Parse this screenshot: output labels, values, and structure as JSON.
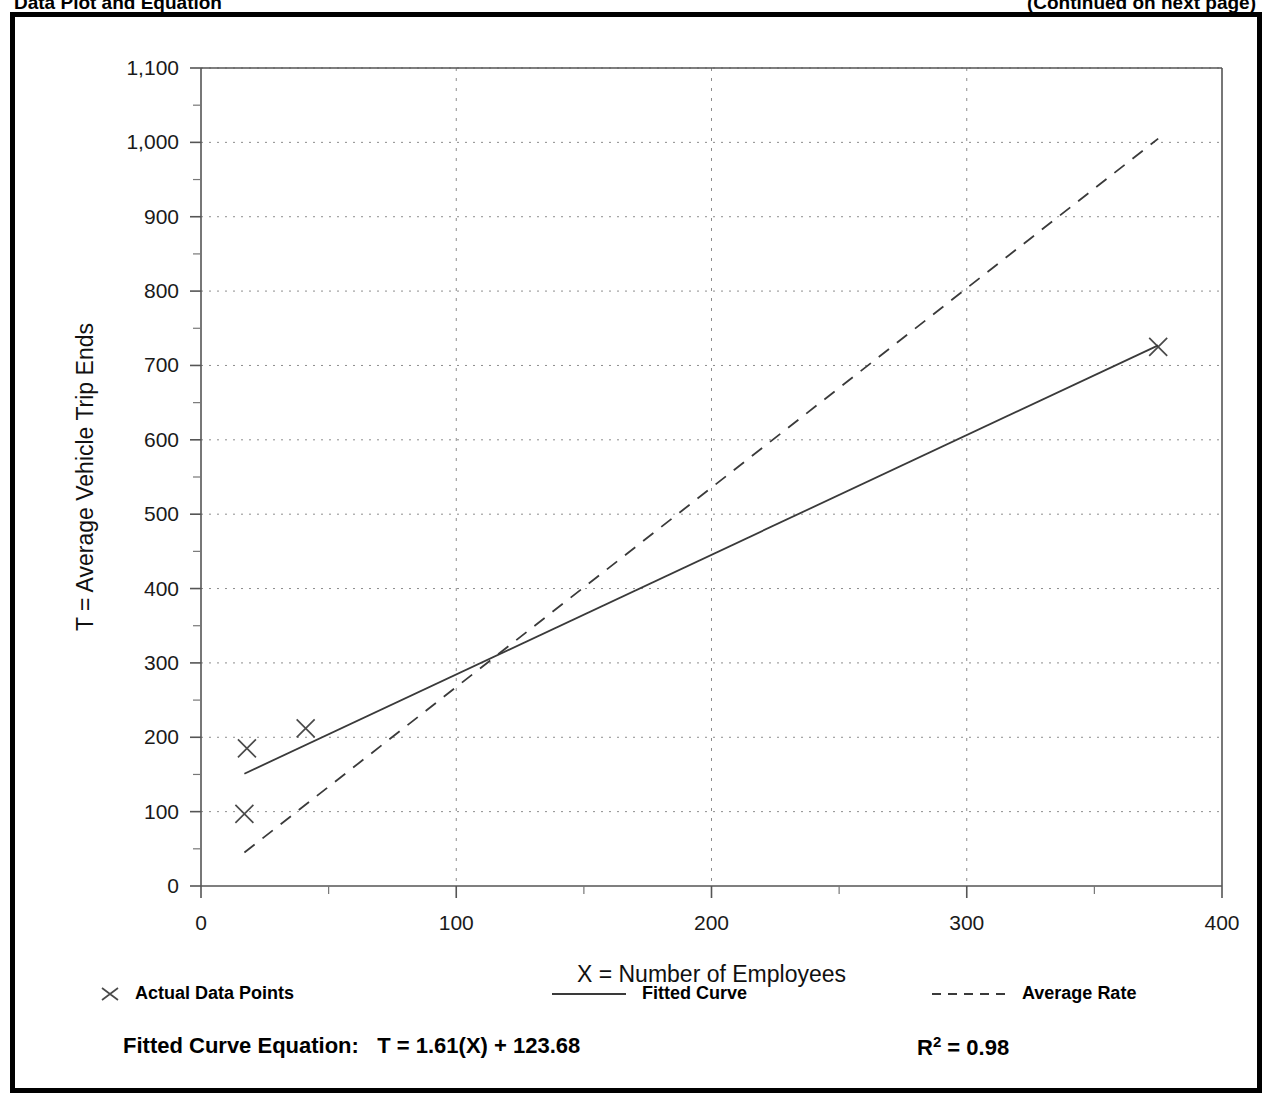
{
  "page": {
    "header_left": "Data Plot and Equation",
    "header_right": "(Continued on next page)"
  },
  "legend": {
    "entries": [
      {
        "label": "Actual Data Points",
        "marker": "x-marker",
        "style": "marker"
      },
      {
        "label": "Fitted Curve",
        "marker": "solid-line",
        "style": "solid"
      },
      {
        "label": "Average Rate",
        "marker": "dashed-line",
        "style": "dashed"
      }
    ]
  },
  "footer": {
    "equation_label": "Fitted Curve Equation:",
    "equation": "T = 1.61(X) + 123.68",
    "r_squared_symbol": "R",
    "r_squared_exponent": "2",
    "r_squared_value": "= 0.98",
    "r_squared_full": "R2 = 0.98"
  },
  "chart_data": {
    "type": "scatter",
    "title": "",
    "xlabel": "X = Number of Employees",
    "ylabel": "T = Average Vehicle Trip Ends",
    "xlim": [
      0,
      400
    ],
    "ylim": [
      0,
      1100
    ],
    "xticks": [
      0,
      100,
      200,
      300,
      400
    ],
    "xtick_labels": [
      "0",
      "100",
      "200",
      "300",
      "400"
    ],
    "xtick_minor_step": 50,
    "yticks": [
      0,
      100,
      200,
      300,
      400,
      500,
      600,
      700,
      800,
      900,
      1000,
      1100
    ],
    "ytick_labels": [
      "0",
      "100",
      "200",
      "300",
      "400",
      "500",
      "600",
      "700",
      "800",
      "900",
      "1,000",
      "1,100"
    ],
    "ytick_minor_step": 50,
    "grid": true,
    "legend_position": "below-plot",
    "series": [
      {
        "name": "Actual Data Points",
        "type": "scatter",
        "marker": "x",
        "points": [
          {
            "x": 17,
            "y": 97
          },
          {
            "x": 18,
            "y": 185
          },
          {
            "x": 41,
            "y": 212
          },
          {
            "x": 375,
            "y": 725
          }
        ]
      },
      {
        "name": "Fitted Curve",
        "type": "line",
        "style": "solid",
        "equation": "T = 1.61(X) + 123.68",
        "r_squared": 0.98,
        "slope": 1.61,
        "intercept": 123.68,
        "endpoints": [
          {
            "x": 17,
            "y": 151
          },
          {
            "x": 375,
            "y": 727
          }
        ]
      },
      {
        "name": "Average Rate",
        "type": "line",
        "style": "dashed",
        "slope": 2.68,
        "endpoints": [
          {
            "x": 17,
            "y": 45
          },
          {
            "x": 375,
            "y": 1005
          }
        ]
      }
    ]
  }
}
